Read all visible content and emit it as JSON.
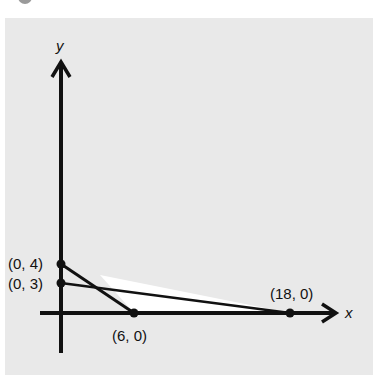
{
  "figure": {
    "axes": {
      "x_label": "x",
      "y_label": "y"
    },
    "points": [
      {
        "id": "p04",
        "label": "(0, 4)",
        "x": 0,
        "y": 4
      },
      {
        "id": "p03",
        "label": "(0, 3)",
        "x": 0,
        "y": 3
      },
      {
        "id": "p60",
        "label": "(6, 0)",
        "x": 6,
        "y": 0
      },
      {
        "id": "p180",
        "label": "(18, 0)",
        "x": 18,
        "y": 0
      }
    ],
    "lines": [
      {
        "from": "(0, 4)",
        "to": "(6, 0)"
      },
      {
        "from": "(0, 3)",
        "to": "(18, 0)"
      }
    ],
    "colors": {
      "panel": "#e9e9e9",
      "ink": "#111111",
      "region": "#ffffff"
    }
  }
}
